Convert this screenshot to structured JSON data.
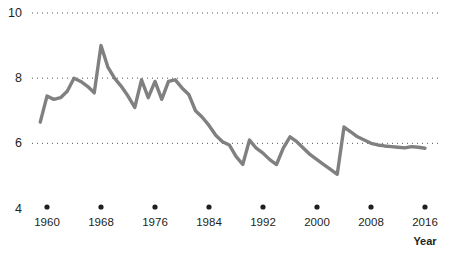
{
  "chart_data": {
    "type": "line",
    "title": "",
    "subtitle": "",
    "xlabel": "Year",
    "ylabel": "",
    "xlim": [
      1959,
      2017
    ],
    "ylim": [
      4,
      10
    ],
    "grid": "horizontal-dotted",
    "legend": "none",
    "y_ticks": [
      {
        "value": 10,
        "label": "10"
      },
      {
        "value": 8,
        "label": "8"
      },
      {
        "value": 6,
        "label": "6"
      },
      {
        "value": 4,
        "label": "4"
      }
    ],
    "x_ticks": [
      {
        "value": 1960,
        "label": "1960"
      },
      {
        "value": 1968,
        "label": "1968"
      },
      {
        "value": 1976,
        "label": "1976"
      },
      {
        "value": 1984,
        "label": "1984"
      },
      {
        "value": 1992,
        "label": "1992"
      },
      {
        "value": 2000,
        "label": "2000"
      },
      {
        "value": 2008,
        "label": "2008"
      },
      {
        "value": 2016,
        "label": "2016"
      }
    ],
    "line_color": "#808080",
    "line_width": 3.4,
    "gridline_color": "#555555",
    "x": [
      1959,
      1960,
      1961,
      1962,
      1963,
      1964,
      1965,
      1966,
      1967,
      1968,
      1969,
      1970,
      1971,
      1972,
      1973,
      1974,
      1975,
      1976,
      1977,
      1978,
      1979,
      1980,
      1981,
      1982,
      1983,
      1984,
      1985,
      1986,
      1987,
      1988,
      1989,
      1990,
      1991,
      1992,
      1993,
      1994,
      1995,
      1996,
      1997,
      1998,
      1999,
      2000,
      2001,
      2002,
      2003,
      2004,
      2005,
      2006,
      2007,
      2008,
      2009,
      2010,
      2011,
      2012,
      2013,
      2014,
      2015,
      2016
    ],
    "values": [
      6.65,
      7.45,
      7.35,
      7.4,
      7.6,
      8.0,
      7.9,
      7.75,
      7.55,
      9.0,
      8.35,
      8.0,
      7.75,
      7.45,
      7.1,
      7.95,
      7.4,
      7.9,
      7.35,
      7.9,
      7.95,
      7.7,
      7.5,
      7.0,
      6.8,
      6.55,
      6.25,
      6.05,
      5.95,
      5.6,
      5.35,
      6.1,
      5.85,
      5.7,
      5.5,
      5.35,
      5.85,
      6.2,
      6.05,
      5.85,
      5.65,
      5.5,
      5.35,
      5.2,
      5.05,
      6.5,
      6.35,
      6.2,
      6.1,
      6.0,
      5.95,
      5.92,
      5.9,
      5.88,
      5.86,
      5.9,
      5.88,
      5.85
    ],
    "note": "Series declines from a 1968 peak near 9 to a 2007 low near 5, with a 2009 rebound and flat tail near 5.9"
  },
  "axis": {
    "x_title": "Year"
  }
}
